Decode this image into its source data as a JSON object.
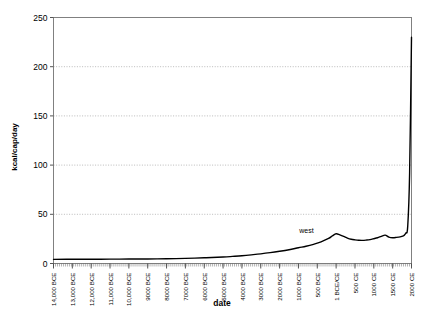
{
  "chart_data": {
    "type": "line",
    "title": "",
    "xlabel": "date",
    "ylabel": "kcal/cap/day",
    "ylim": [
      0,
      250
    ],
    "yticks": [
      0,
      50,
      100,
      150,
      200,
      250
    ],
    "ytick_labels": [
      "0",
      "50",
      "100",
      "150",
      "200",
      "250"
    ],
    "grid": true,
    "grid_axis": "y",
    "grid_style": "dotted",
    "legend": "none",
    "annotations": [
      {
        "text": "west",
        "x": "1000 BCE",
        "y": 33
      }
    ],
    "categories": [
      "14,000 BCE",
      "13,000 BCE",
      "12,000 BCE",
      "11,000 BCE",
      "10,000 BCE",
      "9000 BCE",
      "8000 BCE",
      "7000 BCE",
      "6000 BCE",
      "5000 BCE",
      "4000 BCE",
      "3000 BCE",
      "2000 BCE",
      "1000 BCE",
      "500 BCE",
      "1 BCE/CE",
      "500 CE",
      "1000 CE",
      "1500 CE",
      "2000 CE"
    ],
    "series": [
      {
        "name": "west",
        "color": "#000000",
        "x": [
          -14000,
          -13000,
          -12000,
          -11000,
          -10000,
          -9000,
          -8000,
          -7000,
          -6000,
          -5000,
          -4500,
          -4000,
          -3500,
          -3000,
          -2500,
          -2000,
          -1500,
          -1000,
          -800,
          -600,
          -400,
          -200,
          -100,
          1,
          100,
          200,
          300,
          400,
          500,
          600,
          700,
          800,
          900,
          1000,
          1100,
          1200,
          1300,
          1400,
          1500,
          1600,
          1700,
          1750,
          1800,
          1850,
          1900,
          1950,
          2000
        ],
        "values": [
          4.2,
          4.3,
          4.3,
          4.4,
          4.5,
          4.6,
          4.8,
          5.2,
          5.8,
          6.6,
          7.2,
          7.9,
          8.8,
          9.8,
          11.0,
          12.4,
          14.0,
          16.0,
          17.5,
          19.5,
          22.0,
          25.5,
          28.0,
          30.2,
          29.0,
          27.5,
          25.8,
          24.6,
          24.0,
          23.6,
          23.5,
          23.8,
          24.3,
          25.2,
          26.2,
          27.6,
          28.8,
          26.8,
          26.2,
          26.5,
          27.0,
          27.6,
          28.5,
          31.0,
          38.0,
          92.0,
          230.0
        ]
      }
    ]
  }
}
